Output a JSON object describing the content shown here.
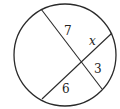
{
  "diagram": {
    "type": "intersecting-chords",
    "circle": {
      "cx": 65,
      "cy": 55,
      "r": 51,
      "stroke": "#2a2a2a"
    },
    "chords": [
      {
        "name": "chord-1",
        "x1": 41,
        "y1": 9,
        "x2": 102,
        "y2": 89
      },
      {
        "name": "chord-2",
        "x1": 42,
        "y1": 99,
        "x2": 112,
        "y2": 33
      }
    ],
    "labels": [
      {
        "name": "segment-label-7",
        "text": "7",
        "x": 64,
        "y": 35,
        "italic": false
      },
      {
        "name": "segment-label-x",
        "text": "x",
        "x": 89,
        "y": 45,
        "italic": true
      },
      {
        "name": "segment-label-3",
        "text": "3",
        "x": 94,
        "y": 73,
        "italic": false
      },
      {
        "name": "segment-label-6",
        "text": "6",
        "x": 62,
        "y": 93,
        "italic": false
      }
    ]
  }
}
